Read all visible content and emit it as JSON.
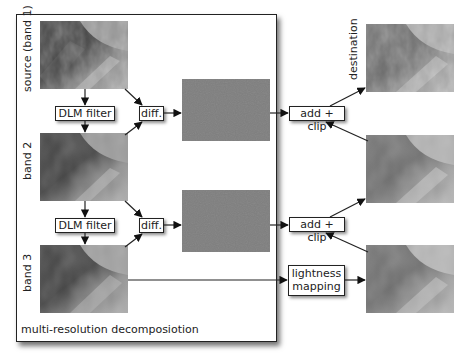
{
  "diagram": {
    "panel_caption": "multi-resolution decomposiotion",
    "bands": [
      {
        "label": "source (band 1)",
        "image": "texture-photo"
      },
      {
        "label": "band 2",
        "image": "texture-photo-blurred"
      },
      {
        "label": "band 3",
        "image": "texture-photo-blurred-more"
      }
    ],
    "filters": [
      {
        "label": "DLM filter"
      },
      {
        "label": "DLM filter"
      }
    ],
    "diffs": [
      {
        "label": "diff."
      },
      {
        "label": "diff."
      }
    ],
    "detail_layers": [
      {
        "color": "#7e7e7e"
      },
      {
        "color": "#7e7e7e"
      }
    ],
    "combiners": [
      {
        "label": "add + clip"
      },
      {
        "label": "add + clip"
      }
    ],
    "lightness": {
      "line1": "lightness",
      "line2": "mapping"
    },
    "destination_label": "destination",
    "outputs": [
      "destination-image",
      "intermediate-image",
      "lightness-mapped-image"
    ]
  }
}
